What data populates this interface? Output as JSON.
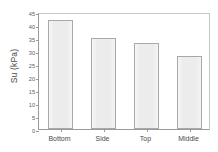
{
  "chart_data": {
    "type": "bar",
    "title": "",
    "xlabel": "",
    "ylabel": "Su (kPa)",
    "categories": [
      "Bottom",
      "Side",
      "Top",
      "Middle"
    ],
    "values": [
      42,
      35,
      33,
      28
    ],
    "ylim": [
      0,
      45
    ],
    "ytick_values": [
      0,
      5,
      10,
      15,
      20,
      25,
      30,
      35,
      40,
      45
    ],
    "ytick_labels": [
      "0",
      "5",
      "10",
      "15",
      "20",
      "25",
      "30",
      "35",
      "40",
      "45"
    ],
    "grid": false,
    "legend": null,
    "series": [
      {
        "name": "Su",
        "values": [
          42,
          35,
          33,
          28
        ]
      }
    ],
    "colors": {
      "bar_fill": "#ececec",
      "bar_edge": "#a8a8a8",
      "axis": "#9a9a9a",
      "text": "#4a4a4a",
      "background": "#ffffff"
    }
  }
}
